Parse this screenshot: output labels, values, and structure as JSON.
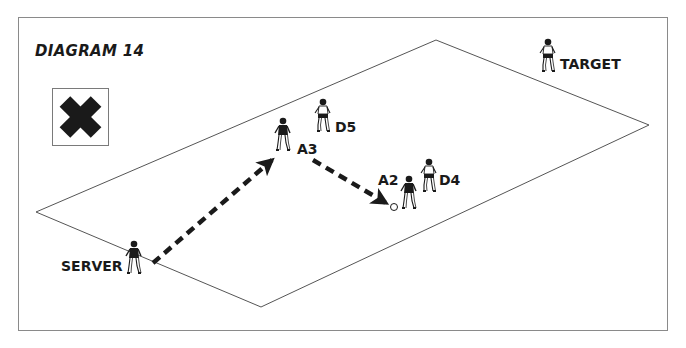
{
  "diagram": {
    "title": "DIAGRAM 14",
    "legend_icon": "x-cross-icon",
    "field": {
      "shape": "isometric-rectangle",
      "corners": {
        "top": [
          436,
          40
        ],
        "right": [
          649,
          125
        ],
        "bottom": [
          261,
          307
        ],
        "left": [
          36,
          212
        ]
      },
      "line_color": "#555555"
    },
    "players": [
      {
        "id": "target",
        "label": "TARGET",
        "x": 548,
        "y": 60,
        "shirt": "light"
      },
      {
        "id": "d5",
        "label": "D5",
        "x": 322,
        "y": 115,
        "shirt": "light"
      },
      {
        "id": "a3",
        "label": "A3",
        "x": 283,
        "y": 133,
        "shirt": "dark"
      },
      {
        "id": "a2",
        "label": "A2",
        "x": 410,
        "y": 190,
        "shirt": "dark"
      },
      {
        "id": "d4",
        "label": "D4",
        "x": 428,
        "y": 175,
        "shirt": "light"
      },
      {
        "id": "server",
        "label": "SERVER",
        "x": 133,
        "y": 258,
        "shirt": "dark"
      }
    ],
    "ball": {
      "x": 394,
      "y": 207
    },
    "passes": [
      {
        "from": "SERVER",
        "to": "A3",
        "start": [
          153,
          263
        ],
        "end": [
          276,
          157
        ],
        "style": "dashed-arrow"
      },
      {
        "from": "A3",
        "to": "A2",
        "start": [
          313,
          160
        ],
        "end": [
          390,
          206
        ],
        "style": "dashed-arrow"
      }
    ],
    "colors": {
      "ink": "#1a1a1a",
      "frame": "#8a8a8a",
      "background": "#ffffff"
    }
  }
}
